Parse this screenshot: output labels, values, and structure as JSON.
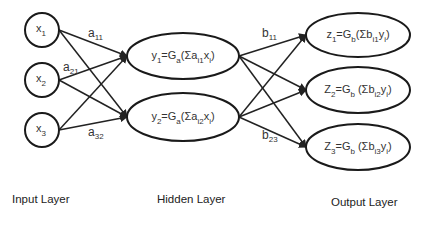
{
  "diagram": {
    "type": "neural-network",
    "input_layer": {
      "label": "Input Layer",
      "nodes": [
        {
          "id": "x1",
          "base": "x",
          "sub": "1"
        },
        {
          "id": "x2",
          "base": "x",
          "sub": "2"
        },
        {
          "id": "x3",
          "base": "x",
          "sub": "3"
        }
      ]
    },
    "hidden_layer": {
      "label": "Hidden Layer",
      "nodes": [
        {
          "id": "y1",
          "base": "y",
          "sub": "1",
          "eq": "=G",
          "g_sub": "a",
          "sum": "(Σa",
          "w_sub": "i1",
          "var": "x",
          "var_sub": "i",
          "close": ")"
        },
        {
          "id": "y2",
          "base": "y",
          "sub": "2",
          "eq": "=G",
          "g_sub": "a",
          "sum": "(Σa",
          "w_sub": "i2",
          "var": "x",
          "var_sub": "i",
          "close": ")"
        }
      ]
    },
    "output_layer": {
      "label": "Output Layer",
      "nodes": [
        {
          "id": "z1",
          "base": "z",
          "sub": "1",
          "eq": "=G",
          "g_sub": "b",
          "sum": "(Σb",
          "w_sub": "i1",
          "var": "y",
          "var_sub": "i",
          "close": ")"
        },
        {
          "id": "z2",
          "base": "Z",
          "sub": "2",
          "eq": "=G",
          "g_sub": "b",
          "sum": " (Σb",
          "w_sub": "i2",
          "var": "y",
          "var_sub": "i",
          "close": ")"
        },
        {
          "id": "z3",
          "base": "Z",
          "sub": "3",
          "eq": "=G",
          "g_sub": "b",
          "sum": " (Σb",
          "w_sub": "i3",
          "var": "y",
          "var_sub": "i",
          "close": ")"
        }
      ]
    },
    "weight_labels": [
      {
        "base": "a",
        "sub": "11"
      },
      {
        "base": "a",
        "sub": "21"
      },
      {
        "base": "a",
        "sub": "32"
      },
      {
        "base": "b",
        "sub": "11"
      },
      {
        "base": "b",
        "sub": "23"
      }
    ],
    "colors": {
      "stroke": "#1a1a1a",
      "text": "#333333",
      "background": "#ffffff"
    }
  }
}
